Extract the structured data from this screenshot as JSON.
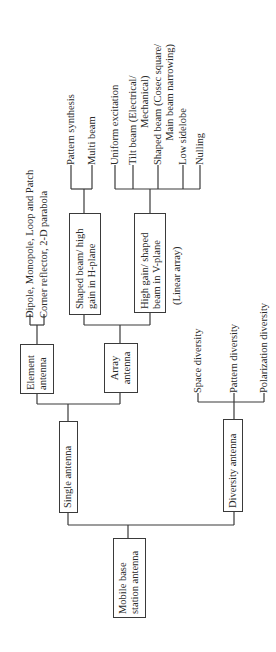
{
  "diagram": {
    "orientation": "rotated-90-ccw",
    "root": {
      "label_line1": "Mobile base",
      "label_line2": "station antenna"
    },
    "single": {
      "label": "Single antenna",
      "element": {
        "label_line1": "Element",
        "label_line2": "antenna",
        "leaves": [
          "Dipole, Monopole, Loop and Patch",
          "Corner reflector, 2-D parabola"
        ]
      },
      "array": {
        "label_line1": "Array",
        "label_line2": "antenna",
        "h_plane": {
          "label_line1": "Shaped beam/ high",
          "label_line2": "gain in H-plane",
          "leaves": [
            "Pattern synthesis",
            "Multi beam"
          ]
        },
        "v_plane": {
          "label_line1": "High gain/ shaped",
          "label_line2": "beam in V-plane",
          "note": "(Linear array)",
          "leaves": [
            {
              "line1": "Uniform excitation"
            },
            {
              "line1": "Tilt beam (Electrical/",
              "line2": "Mechanical)"
            },
            {
              "line1": "Shaped beam (Cosec square/",
              "line2": "Main beam narrowing)"
            },
            {
              "line1": "Low sidelobe"
            },
            {
              "line1": "Nulling"
            }
          ]
        }
      }
    },
    "diversity": {
      "label": "Diversity antenna",
      "leaves": [
        "Space diversity",
        "Pattern diversity",
        "Polarization diversity"
      ]
    }
  }
}
